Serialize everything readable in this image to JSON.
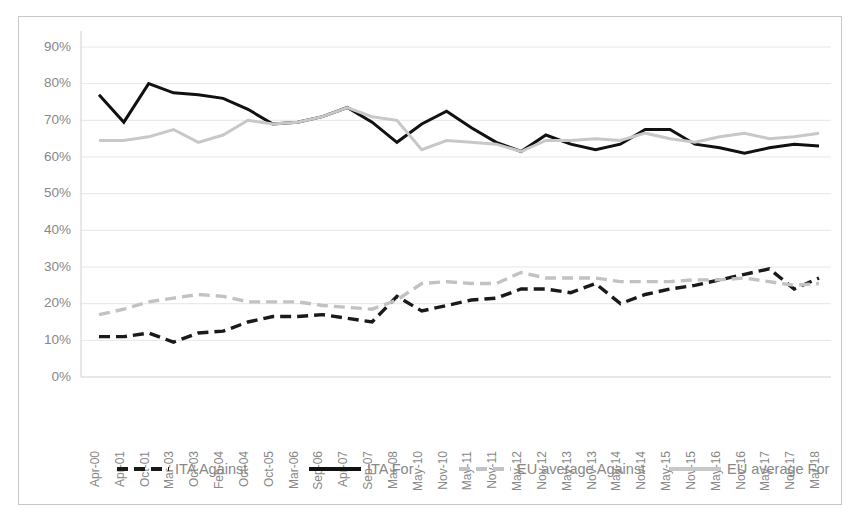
{
  "chart_data": {
    "type": "line",
    "title": "",
    "xlabel": "",
    "ylabel": "",
    "ylim": [
      0,
      0.9
    ],
    "ytick_labels": [
      "90%",
      "80%",
      "70%",
      "60%",
      "50%",
      "40%",
      "30%",
      "20%",
      "10%",
      "0%"
    ],
    "ytick_values": [
      90,
      80,
      70,
      60,
      50,
      40,
      30,
      20,
      10,
      0
    ],
    "grid": true,
    "legend_position": "bottom",
    "categories": [
      "Apr-00",
      "Apr-01",
      "Oct-01",
      "Mar-03",
      "Oct-03",
      "Feb-04",
      "Oct-04",
      "Oct-05",
      "Mar-06",
      "Sep-06",
      "Apr-07",
      "Sep-07",
      "Mar-08",
      "May-10",
      "Nov-10",
      "May-11",
      "Nov-11",
      "May-12",
      "Nov-12",
      "May-13",
      "Nov-13",
      "May-14",
      "Nov-14",
      "May-15",
      "Nov-15",
      "May-16",
      "Nov-16",
      "May-17",
      "Nov-17",
      "Mar-18"
    ],
    "series": [
      {
        "name": "ITA Against",
        "color": "#1a1a1a",
        "style": "dashed",
        "values": [
          11,
          11,
          12,
          9.5,
          12,
          12.5,
          15,
          16.5,
          16.5,
          17,
          16,
          15,
          22,
          18,
          19.5,
          21,
          21.5,
          24,
          24,
          23,
          25.5,
          20,
          22.5,
          24,
          25,
          26.5,
          28,
          29.5,
          24,
          27
        ]
      },
      {
        "name": "ITA For",
        "color": "#111111",
        "style": "solid",
        "values": [
          77,
          69.5,
          80,
          77.5,
          77,
          76,
          73,
          69,
          69.5,
          71,
          73.5,
          69.5,
          64,
          69,
          72.5,
          68,
          64,
          61.5,
          66,
          63.5,
          62,
          63.5,
          67.5,
          67.5,
          63.5,
          62.5,
          61,
          62.5,
          63.5,
          63
        ]
      },
      {
        "name": "EU average Against",
        "color": "#c2c2c2",
        "style": "dashed",
        "values": [
          17,
          18.5,
          20.5,
          21.5,
          22.5,
          22,
          20.5,
          20.5,
          20.5,
          19.5,
          19,
          18.5,
          21,
          25.5,
          26,
          25.5,
          25.5,
          28.5,
          27,
          27,
          27,
          26,
          26,
          26,
          26.5,
          26.5,
          27,
          26,
          25,
          25.5
        ]
      },
      {
        "name": "EU average For",
        "color": "#c8c8c8",
        "style": "solid",
        "values": [
          64.5,
          64.5,
          65.5,
          67.5,
          64,
          66,
          70,
          69,
          69.5,
          71,
          73.5,
          71,
          70,
          62,
          64.5,
          64,
          63.5,
          61.5,
          64.5,
          64.5,
          65,
          64.5,
          66.5,
          65,
          64,
          65.5,
          66.5,
          65,
          65.5,
          66.5
        ]
      }
    ]
  },
  "legend": {
    "items": [
      {
        "label": "ITA Against"
      },
      {
        "label": "ITA For"
      },
      {
        "label": "EU average Against"
      },
      {
        "label": "EU average For"
      }
    ]
  }
}
